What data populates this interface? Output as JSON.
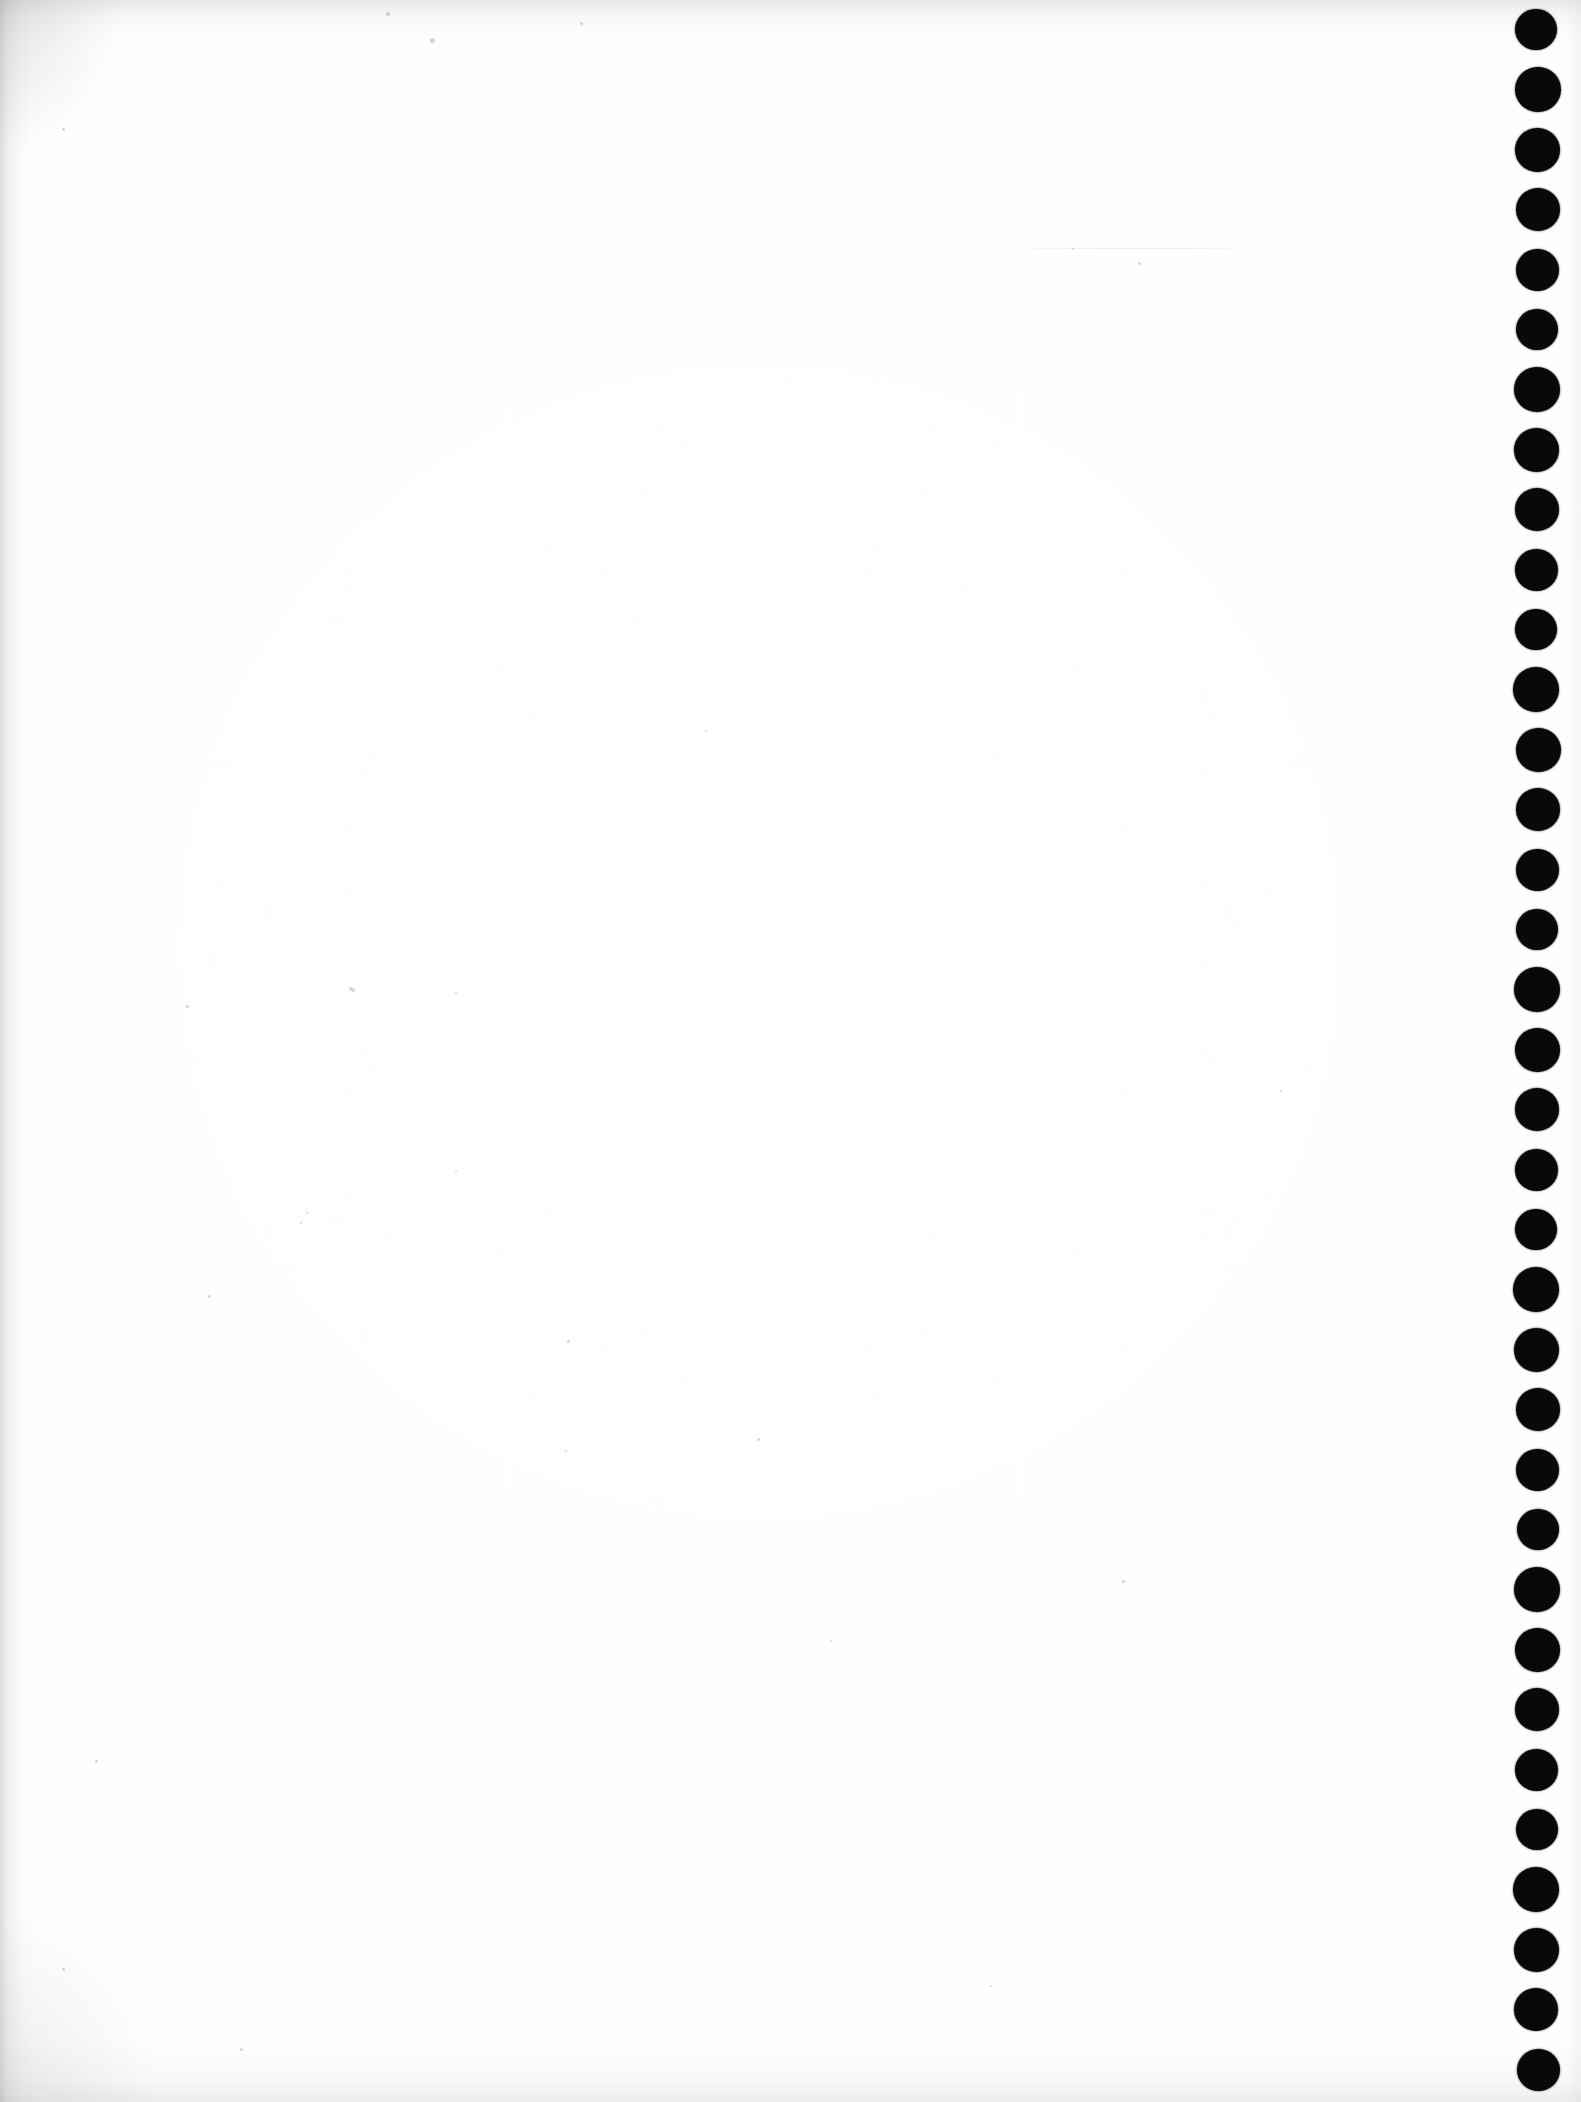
{
  "document": {
    "kind": "scanned-blank-page",
    "title": "Scanned Blank Page",
    "visible_text": "",
    "page_width": 1581,
    "page_height": 2102,
    "background_color": "#ffffff",
    "paper_tone": "#fefefe",
    "has_text": false,
    "has_figures": false,
    "note": ""
  },
  "binding_marks": {
    "name": "punch-hole-column",
    "count": 35,
    "color": "#090909",
    "diameter": 44,
    "spacing": 60,
    "center_x": 1537,
    "first_center_y": 30,
    "edge": "right"
  },
  "scan_artifacts": {
    "left_edge_shadow_color": "#8c8e94",
    "top_edge_shadow_color": "#969298",
    "bottom_edge_shadow_color": "#9b9da3",
    "grain_speck_color": "#787a82",
    "seam_color": "#b9bbc1"
  },
  "flecks": [
    {
      "x": 386,
      "y": 12,
      "size": 4
    },
    {
      "x": 580,
      "y": 22,
      "size": 3
    },
    {
      "x": 430,
      "y": 38,
      "size": 5
    },
    {
      "x": 62,
      "y": 128,
      "size": 3
    },
    {
      "x": 1138,
      "y": 262,
      "size": 3
    },
    {
      "x": 1072,
      "y": 248,
      "size": 2
    },
    {
      "x": 349,
      "y": 987,
      "size": 3
    },
    {
      "x": 351,
      "y": 988,
      "size": 4
    },
    {
      "x": 455,
      "y": 992,
      "size": 2
    },
    {
      "x": 186,
      "y": 1005,
      "size": 3
    },
    {
      "x": 300,
      "y": 1222,
      "size": 2
    },
    {
      "x": 567,
      "y": 1340,
      "size": 3
    },
    {
      "x": 208,
      "y": 1295,
      "size": 3
    },
    {
      "x": 455,
      "y": 1170,
      "size": 2
    },
    {
      "x": 757,
      "y": 1438,
      "size": 3
    },
    {
      "x": 1122,
      "y": 1580,
      "size": 3
    },
    {
      "x": 565,
      "y": 1450,
      "size": 2
    },
    {
      "x": 306,
      "y": 1212,
      "size": 2
    },
    {
      "x": 95,
      "y": 1760,
      "size": 3
    },
    {
      "x": 62,
      "y": 1968,
      "size": 3
    },
    {
      "x": 240,
      "y": 2048,
      "size": 3
    },
    {
      "x": 830,
      "y": 1640,
      "size": 2
    },
    {
      "x": 1280,
      "y": 1090,
      "size": 2
    },
    {
      "x": 705,
      "y": 730,
      "size": 2
    },
    {
      "x": 990,
      "y": 1985,
      "size": 2
    }
  ],
  "seams": [
    {
      "x": 990,
      "y": 248,
      "width": 270
    }
  ]
}
